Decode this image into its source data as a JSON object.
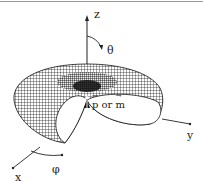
{
  "figure": {
    "type": "radiation-pattern-torus",
    "colors": {
      "mesh": "#111111",
      "axis": "#222222",
      "background": "#ffffff",
      "frame_line": "#9a9a9a"
    }
  },
  "axes": {
    "z_label": "z",
    "y_label": "y",
    "x_label": "x",
    "theta_label": "θ",
    "phi_label": "φ"
  },
  "dipole": {
    "p_symbol": "p",
    "connector": "or",
    "m_symbol": "m"
  }
}
